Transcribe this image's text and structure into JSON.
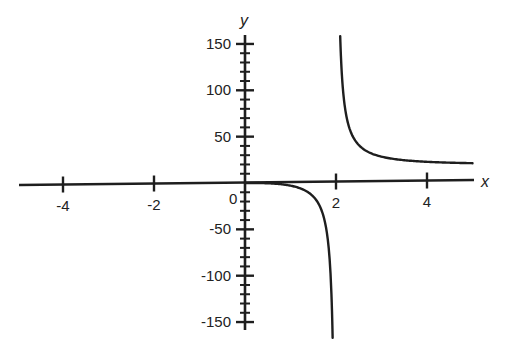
{
  "chart_data": {
    "type": "line",
    "title": "",
    "xlabel": "x",
    "ylabel": "y",
    "xlim": [
      -5,
      5
    ],
    "ylim": [
      -160,
      160
    ],
    "grid": false,
    "legend": null,
    "x_ticks": [
      -4,
      -2,
      0,
      2,
      4
    ],
    "x_tick_labels": [
      "-4",
      "-2",
      "0",
      "2",
      "4"
    ],
    "y_ticks": [
      150,
      100,
      50,
      -50,
      -100,
      -150
    ],
    "y_tick_labels": [
      "150",
      "100",
      "50",
      "-50",
      "-100",
      "-150"
    ],
    "y_minor_tick_step": 10,
    "vertical_asymptote": 2,
    "horizontal_asymptote": 20,
    "series": [
      {
        "name": "left branch (0 ≤ x < 2)",
        "x": [
          0,
          0.5,
          1.0,
          1.25,
          1.43,
          1.5,
          1.65,
          1.75,
          1.8,
          1.85,
          1.87,
          1.9,
          1.93
        ],
        "y": [
          0,
          -0.32,
          -2.86,
          -6.2,
          -11.5,
          -14.5,
          -25.6,
          -37.9,
          -49.9,
          -68.0,
          -89.6,
          -117,
          -160
        ]
      },
      {
        "name": "right branch (2 < x ≤ 5)",
        "x": [
          2.1,
          2.15,
          2.2,
          2.3,
          2.5,
          2.75,
          3.0,
          3.5,
          4.0,
          4.5,
          5.0
        ],
        "y": [
          155,
          117,
          80,
          58,
          41,
          32.3,
          27.1,
          23.0,
          22.9,
          21.8,
          21.4
        ]
      }
    ]
  },
  "labels": {
    "x_axis": "x",
    "y_axis": "y",
    "origin": "0"
  },
  "style": {
    "line_color": "#1e1e1e",
    "axis_color": "#1e1e1e",
    "text_color": "#222222"
  }
}
